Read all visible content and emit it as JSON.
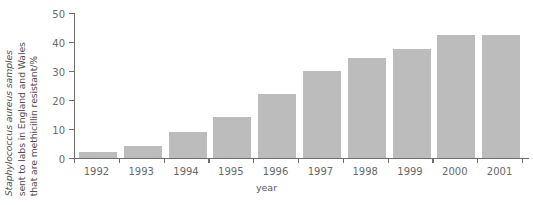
{
  "chart_data": {
    "type": "bar",
    "title": "",
    "xlabel": "year",
    "ylabel_lines": [
      "Staphylococcus aureus samples",
      "sent to labs in England and Wales",
      "that are methicillin resistant/%"
    ],
    "ylabel": "Staphylococcus aureus samples sent to labs in England and Wales that are methicillin resistant/%",
    "categories": [
      "1992",
      "1993",
      "1994",
      "1995",
      "1996",
      "1997",
      "1998",
      "1999",
      "2000",
      "2001"
    ],
    "values": [
      2,
      4,
      9,
      14,
      22,
      30,
      34.5,
      37.5,
      42.5,
      42.5
    ],
    "ylim": [
      0,
      50
    ],
    "yticks": [
      0,
      10,
      20,
      30,
      40,
      50
    ],
    "ytick_labels": [
      "0",
      "10",
      "20",
      "30",
      "40",
      "50"
    ],
    "grid": false,
    "legend": "none",
    "bar_color": "#bcbcbc",
    "axis_color": "#6e6e6e",
    "background": "#ffffff"
  }
}
